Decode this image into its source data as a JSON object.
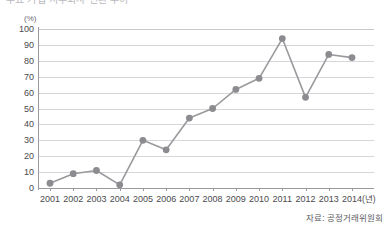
{
  "chart_data": {
    "type": "line",
    "title": "주요 기업 지주회사 전환 추이",
    "ylabel": "(%)",
    "xlabel": "(년)",
    "ylim": [
      0,
      100
    ],
    "ytick_step": 10,
    "yticks": [
      "100",
      "90",
      "80",
      "70",
      "60",
      "50",
      "40",
      "30",
      "20",
      "10",
      "0"
    ],
    "categories": [
      "2001",
      "2002",
      "2003",
      "2004",
      "2005",
      "2006",
      "2007",
      "2008",
      "2009",
      "2010",
      "2011",
      "2012",
      "2013",
      "2014"
    ],
    "values": [
      3,
      9,
      11,
      2,
      30,
      24,
      44,
      50,
      62,
      69,
      94,
      57,
      84,
      82
    ],
    "grid": true,
    "legend": "none",
    "source": "자료: 공정거래위원회",
    "series_color": "#9a9a9e",
    "marker_color": "#8c8c90",
    "gridline_color": "#d7d7da",
    "axis_color": "#9a9a9e"
  }
}
